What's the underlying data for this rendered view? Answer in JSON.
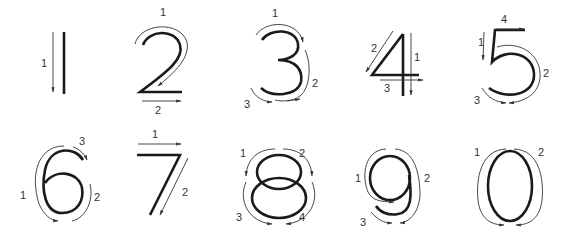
{
  "colors": {
    "glyph": "#1a1a1a",
    "guide": "#333333",
    "background": "#ffffff"
  },
  "digits": [
    {
      "digit": "1",
      "strokes": [
        {
          "order": "1",
          "direction": "down"
        }
      ]
    },
    {
      "digit": "2",
      "strokes": [
        {
          "order": "1",
          "direction": "curve clockwise then diagonal down-left"
        },
        {
          "order": "2",
          "direction": "right"
        }
      ]
    },
    {
      "digit": "3",
      "strokes": [
        {
          "order": "1",
          "direction": "upper curve clockwise"
        },
        {
          "order": "2",
          "direction": "lower curve clockwise"
        },
        {
          "order": "3",
          "direction": "bottom curve"
        }
      ]
    },
    {
      "digit": "4",
      "strokes": [
        {
          "order": "1",
          "direction": "down"
        },
        {
          "order": "2",
          "direction": "diagonal down-left"
        },
        {
          "order": "3",
          "direction": "right"
        }
      ]
    },
    {
      "digit": "5",
      "strokes": [
        {
          "order": "1",
          "direction": "down"
        },
        {
          "order": "2",
          "direction": "curve clockwise"
        },
        {
          "order": "3",
          "direction": "bottom curve"
        },
        {
          "order": "4",
          "direction": "right"
        }
      ]
    },
    {
      "digit": "6",
      "strokes": [
        {
          "order": "1",
          "direction": "counter-clockwise down"
        },
        {
          "order": "2",
          "direction": "loop up"
        },
        {
          "order": "3",
          "direction": "top hook"
        }
      ]
    },
    {
      "digit": "7",
      "strokes": [
        {
          "order": "1",
          "direction": "right"
        },
        {
          "order": "2",
          "direction": "diagonal down-left"
        }
      ]
    },
    {
      "digit": "8",
      "strokes": [
        {
          "order": "1",
          "direction": "top left"
        },
        {
          "order": "2",
          "direction": "top right"
        },
        {
          "order": "3",
          "direction": "bottom left"
        },
        {
          "order": "4",
          "direction": "bottom right"
        }
      ]
    },
    {
      "digit": "9",
      "strokes": [
        {
          "order": "1",
          "direction": "counter-clockwise"
        },
        {
          "order": "2",
          "direction": "clockwise down"
        },
        {
          "order": "3",
          "direction": "bottom hook"
        }
      ]
    },
    {
      "digit": "0",
      "strokes": [
        {
          "order": "1",
          "direction": "counter-clockwise"
        },
        {
          "order": "2",
          "direction": "clockwise"
        }
      ]
    }
  ]
}
